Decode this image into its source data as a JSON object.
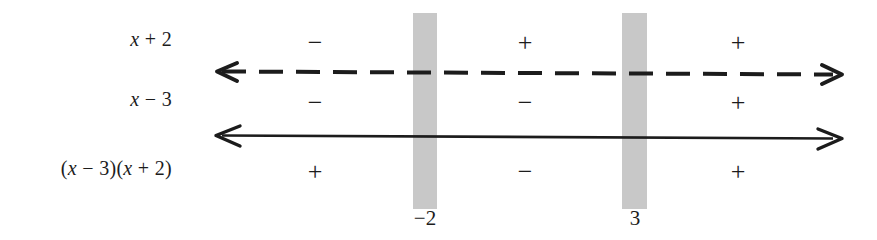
{
  "diagram": {
    "type": "sign-chart",
    "background_color": "#ffffff",
    "ink_color": "#1c1c1c",
    "band_color": "#c8c8c8"
  },
  "rows": [
    {
      "label": "x + 2",
      "label_parts": {
        "variable": "x",
        "rest": " + 2"
      },
      "signs": [
        "−",
        "+",
        "+"
      ],
      "line_style": "dashed"
    },
    {
      "label": "x − 3",
      "label_parts": {
        "variable": "x",
        "rest": " − 3"
      },
      "signs": [
        "−",
        "−",
        "+"
      ],
      "line_style": "solid"
    },
    {
      "label": "(x − 3)(x + 2)",
      "label_parts": {
        "variable": "x",
        "rest": ""
      },
      "signs": [
        "+",
        "−",
        "+"
      ],
      "line_style": "none"
    }
  ],
  "critical_values": [
    {
      "value": "−2",
      "numeric": -2
    },
    {
      "value": "3",
      "numeric": 3
    }
  ],
  "labels": {
    "row1": "x + 2",
    "row2": "x − 3",
    "row3": "(x − 3)(x + 2)"
  },
  "signs": {
    "r1c1": "−",
    "r1c2": "+",
    "r1c3": "+",
    "r2c1": "−",
    "r2c2": "−",
    "r2c3": "+",
    "r3c1": "+",
    "r3c2": "−",
    "r3c3": "+"
  },
  "tick_labels": {
    "first": "−2",
    "second": "3"
  },
  "chart_data": {
    "type": "table",
    "xlabel": "x",
    "ylabel": "",
    "grid": false,
    "legend": "none",
    "critical_points": [
      -2,
      3
    ],
    "intervals": [
      "(-inf, -2)",
      "(-2, 3)",
      "(3, inf)"
    ],
    "categories": [
      "(-inf, -2)",
      "(-2, 3)",
      "(3, inf)"
    ],
    "series": [
      {
        "name": "x + 2",
        "values": [
          "-",
          "+",
          "+"
        ]
      },
      {
        "name": "x - 3",
        "values": [
          "-",
          "-",
          "+"
        ]
      },
      {
        "name": "(x - 3)(x + 2)",
        "values": [
          "+",
          "-",
          "+"
        ]
      }
    ],
    "annotations": [
      {
        "text": "-2",
        "x": -2,
        "position": "below-axis"
      },
      {
        "text": "3",
        "x": 3,
        "position": "below-axis"
      }
    ]
  }
}
